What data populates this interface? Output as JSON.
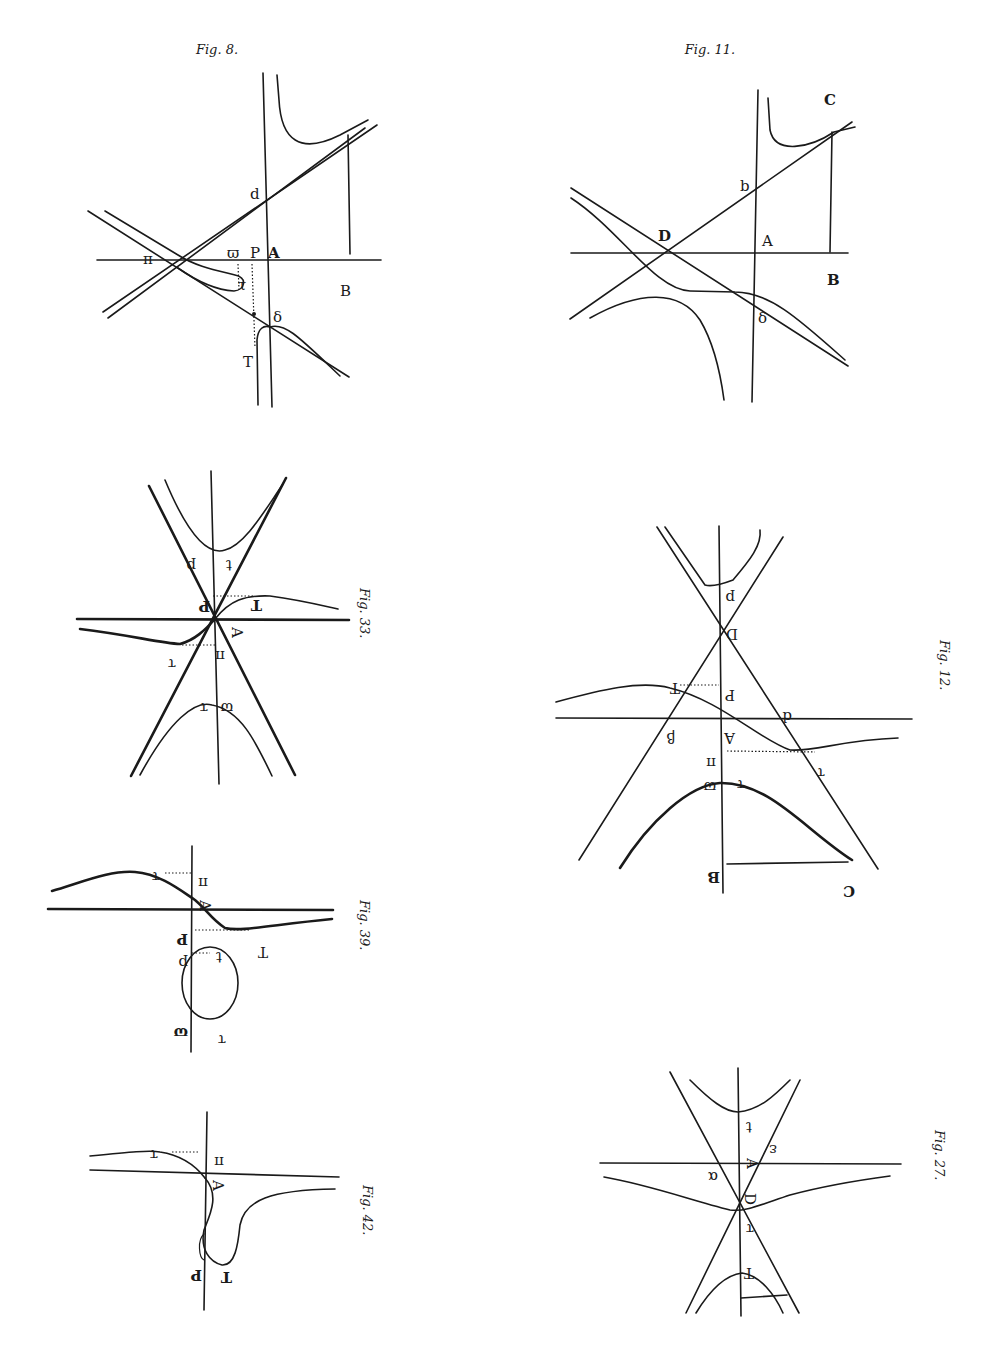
{
  "page": {
    "background": "#ffffff",
    "ink": "#1a1a1a"
  },
  "figures": [
    {
      "id": "fig8",
      "caption": "Fig. 8.",
      "orientation": "upright",
      "labels": {
        "d": "d",
        "varpi": "ϖ",
        "P": "P",
        "A": "A",
        "B": "B",
        "delta": "δ",
        "T": "T",
        "tau": "τ",
        "pi": "π"
      }
    },
    {
      "id": "fig11",
      "caption": "Fig. 11.",
      "orientation": "upright",
      "labels": {
        "C": "C",
        "b": "b",
        "D": "D",
        "A": "A",
        "B": "B",
        "delta": "δ"
      }
    },
    {
      "id": "fig33",
      "caption": "Fig. 33.",
      "orientation": "rotated",
      "labels": {
        "p": "p",
        "t": "t",
        "P": "P",
        "T": "T",
        "A": "A",
        "pi": "π",
        "tau": "τ",
        "varpi": "ϖ",
        "tau2": "τ"
      }
    },
    {
      "id": "fig12",
      "caption": "Fig. 12.",
      "orientation": "rotated",
      "labels": {
        "p": "p",
        "D": "D",
        "T": "T",
        "P": "P",
        "d": "d",
        "beta": "β",
        "A": "A",
        "pi": "π",
        "tau": "τ",
        "varpi": "ϖ",
        "t": "τ",
        "B": "B",
        "C": "C"
      }
    },
    {
      "id": "fig39",
      "caption": "Fig. 39.",
      "orientation": "rotated",
      "labels": {
        "tau": "τ",
        "pi": "π",
        "A": "A",
        "P": "P",
        "T": "T",
        "p": "p",
        "t": "t",
        "varpi": "ϖ",
        "tau2": "τ"
      }
    },
    {
      "id": "fig27",
      "caption": "Fig. 27.",
      "orientation": "rotated",
      "labels": {
        "t": "t",
        "A": "A",
        "epsilon": "ε",
        "alpha": "α",
        "D": "D",
        "tau": "τ",
        "T": "T"
      }
    },
    {
      "id": "fig42",
      "caption": "Fig. 42.",
      "orientation": "rotated",
      "labels": {
        "tau": "τ",
        "pi": "π",
        "A": "A",
        "P": "P",
        "T": "T"
      }
    }
  ]
}
